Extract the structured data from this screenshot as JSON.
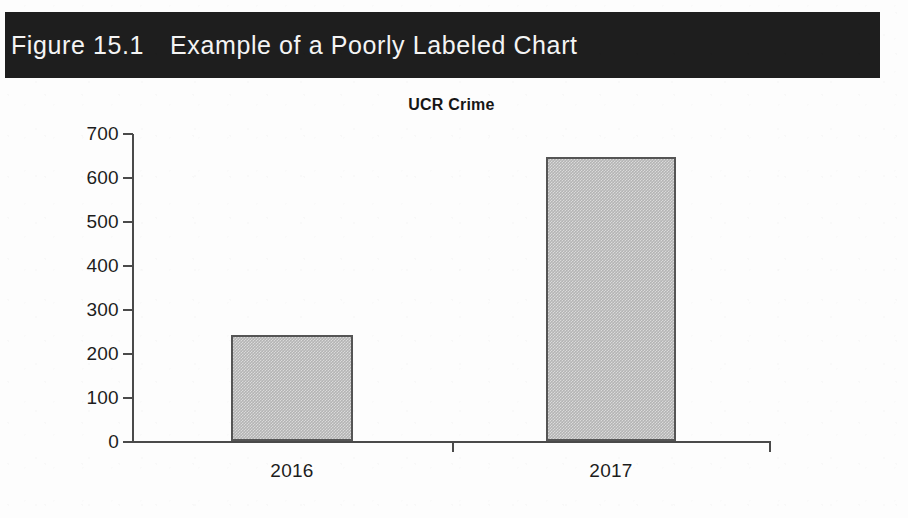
{
  "figure": {
    "number": "Figure 15.1",
    "title": "Example of a Poorly Labeled Chart",
    "banner_bg": "#1e1e1e",
    "banner_text_color": "#f4f4f4"
  },
  "page": {
    "background": "#fdfdfd"
  },
  "chart_data": {
    "type": "bar",
    "title": "UCR Crime",
    "xlabel": "",
    "ylabel": "",
    "categories": [
      "2016",
      "2017"
    ],
    "values": [
      240,
      645
    ],
    "series": [
      {
        "name": "UCR Crime",
        "values": [
          240,
          645
        ]
      }
    ],
    "ylim": [
      0,
      700
    ],
    "ytick_labels": [
      "700",
      "600",
      "500",
      "400",
      "300",
      "200",
      "100",
      "0"
    ],
    "ytick_values": [
      700,
      600,
      500,
      400,
      300,
      200,
      100,
      0
    ],
    "xtick_labels": [
      "2016",
      "2017"
    ],
    "grid": false,
    "legend": false,
    "legend_position": "none",
    "bar_fill_color": "#b4b4b4",
    "bar_border_color": "#555555",
    "axis_color": "#4a4a4a"
  }
}
